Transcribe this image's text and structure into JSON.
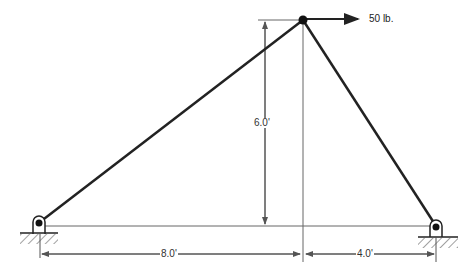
{
  "diagram": {
    "type": "truss",
    "load": {
      "label": "50 lb.",
      "direction": "right"
    },
    "dimensions": {
      "height": "6.0'",
      "left_span": "8.0'",
      "right_span": "4.0'"
    },
    "nodes": {
      "apex": "pinned joint",
      "left_support": "pin support",
      "right_support": "pin support"
    },
    "colors": {
      "member": "#222222",
      "dimension": "#555555"
    }
  }
}
